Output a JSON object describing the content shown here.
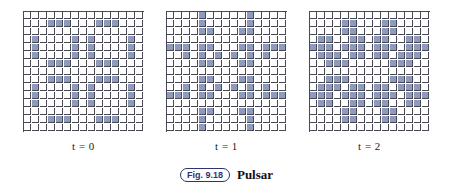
{
  "figure": {
    "tag": "Fig. 9.18",
    "title": "Pulsar",
    "colors": {
      "live_cell": "#8f9abf",
      "dead_cell": "#ffffff",
      "grid_line": "#4a4a55",
      "tag_text": "#2d3470",
      "caption_text": "#111118"
    }
  },
  "panels": [
    {
      "label": "t = 0",
      "grid": {
        "rows": 15,
        "cols": 15,
        "live": [
          [
            1,
            3
          ],
          [
            1,
            4
          ],
          [
            1,
            5
          ],
          [
            1,
            9
          ],
          [
            1,
            10
          ],
          [
            1,
            11
          ],
          [
            3,
            1
          ],
          [
            3,
            6
          ],
          [
            3,
            8
          ],
          [
            3,
            13
          ],
          [
            4,
            1
          ],
          [
            4,
            6
          ],
          [
            4,
            8
          ],
          [
            4,
            13
          ],
          [
            5,
            1
          ],
          [
            5,
            6
          ],
          [
            5,
            8
          ],
          [
            5,
            13
          ],
          [
            6,
            3
          ],
          [
            6,
            4
          ],
          [
            6,
            5
          ],
          [
            6,
            9
          ],
          [
            6,
            10
          ],
          [
            6,
            11
          ],
          [
            8,
            3
          ],
          [
            8,
            4
          ],
          [
            8,
            5
          ],
          [
            8,
            9
          ],
          [
            8,
            10
          ],
          [
            8,
            11
          ],
          [
            9,
            1
          ],
          [
            9,
            6
          ],
          [
            9,
            8
          ],
          [
            9,
            13
          ],
          [
            10,
            1
          ],
          [
            10,
            6
          ],
          [
            10,
            8
          ],
          [
            10,
            13
          ],
          [
            11,
            1
          ],
          [
            11,
            6
          ],
          [
            11,
            8
          ],
          [
            11,
            13
          ],
          [
            13,
            3
          ],
          [
            13,
            4
          ],
          [
            13,
            5
          ],
          [
            13,
            9
          ],
          [
            13,
            10
          ],
          [
            13,
            11
          ]
        ]
      }
    },
    {
      "label": "t = 1",
      "grid": {
        "rows": 15,
        "cols": 15,
        "live": [
          [
            0,
            4
          ],
          [
            0,
            10
          ],
          [
            1,
            4
          ],
          [
            1,
            10
          ],
          [
            2,
            4
          ],
          [
            2,
            5
          ],
          [
            2,
            9
          ],
          [
            2,
            10
          ],
          [
            4,
            0
          ],
          [
            4,
            1
          ],
          [
            4,
            2
          ],
          [
            4,
            4
          ],
          [
            4,
            5
          ],
          [
            4,
            9
          ],
          [
            4,
            10
          ],
          [
            4,
            12
          ],
          [
            4,
            13
          ],
          [
            4,
            14
          ],
          [
            5,
            2
          ],
          [
            5,
            4
          ],
          [
            5,
            6
          ],
          [
            5,
            8
          ],
          [
            5,
            10
          ],
          [
            5,
            12
          ],
          [
            6,
            4
          ],
          [
            6,
            5
          ],
          [
            6,
            9
          ],
          [
            6,
            10
          ],
          [
            8,
            4
          ],
          [
            8,
            5
          ],
          [
            8,
            9
          ],
          [
            8,
            10
          ],
          [
            9,
            2
          ],
          [
            9,
            4
          ],
          [
            9,
            6
          ],
          [
            9,
            8
          ],
          [
            9,
            10
          ],
          [
            9,
            12
          ],
          [
            10,
            0
          ],
          [
            10,
            1
          ],
          [
            10,
            2
          ],
          [
            10,
            4
          ],
          [
            10,
            5
          ],
          [
            10,
            9
          ],
          [
            10,
            10
          ],
          [
            10,
            12
          ],
          [
            10,
            13
          ],
          [
            10,
            14
          ],
          [
            12,
            4
          ],
          [
            12,
            5
          ],
          [
            12,
            9
          ],
          [
            12,
            10
          ],
          [
            13,
            4
          ],
          [
            13,
            10
          ],
          [
            14,
            4
          ],
          [
            14,
            10
          ]
        ]
      }
    },
    {
      "label": "t = 2",
      "grid": {
        "rows": 15,
        "cols": 15,
        "live": [
          [
            1,
            4
          ],
          [
            1,
            5
          ],
          [
            1,
            9
          ],
          [
            1,
            10
          ],
          [
            2,
            4
          ],
          [
            2,
            5
          ],
          [
            2,
            9
          ],
          [
            2,
            10
          ],
          [
            3,
            1
          ],
          [
            3,
            2
          ],
          [
            3,
            5
          ],
          [
            3,
            6
          ],
          [
            3,
            8
          ],
          [
            3,
            9
          ],
          [
            3,
            12
          ],
          [
            3,
            13
          ],
          [
            4,
            0
          ],
          [
            4,
            1
          ],
          [
            4,
            2
          ],
          [
            4,
            4
          ],
          [
            4,
            5
          ],
          [
            4,
            6
          ],
          [
            4,
            8
          ],
          [
            4,
            9
          ],
          [
            4,
            10
          ],
          [
            4,
            12
          ],
          [
            4,
            13
          ],
          [
            4,
            14
          ],
          [
            5,
            1
          ],
          [
            5,
            2
          ],
          [
            5,
            3
          ],
          [
            5,
            5
          ],
          [
            5,
            6
          ],
          [
            5,
            8
          ],
          [
            5,
            9
          ],
          [
            5,
            11
          ],
          [
            5,
            12
          ],
          [
            5,
            13
          ],
          [
            6,
            2
          ],
          [
            6,
            3
          ],
          [
            6,
            4
          ],
          [
            6,
            10
          ],
          [
            6,
            11
          ],
          [
            6,
            12
          ],
          [
            8,
            2
          ],
          [
            8,
            3
          ],
          [
            8,
            4
          ],
          [
            8,
            10
          ],
          [
            8,
            11
          ],
          [
            8,
            12
          ],
          [
            9,
            1
          ],
          [
            9,
            2
          ],
          [
            9,
            3
          ],
          [
            9,
            5
          ],
          [
            9,
            6
          ],
          [
            9,
            8
          ],
          [
            9,
            9
          ],
          [
            9,
            11
          ],
          [
            9,
            12
          ],
          [
            9,
            13
          ],
          [
            10,
            0
          ],
          [
            10,
            1
          ],
          [
            10,
            2
          ],
          [
            10,
            4
          ],
          [
            10,
            5
          ],
          [
            10,
            6
          ],
          [
            10,
            8
          ],
          [
            10,
            9
          ],
          [
            10,
            10
          ],
          [
            10,
            12
          ],
          [
            10,
            13
          ],
          [
            10,
            14
          ],
          [
            11,
            1
          ],
          [
            11,
            2
          ],
          [
            11,
            5
          ],
          [
            11,
            6
          ],
          [
            11,
            8
          ],
          [
            11,
            9
          ],
          [
            11,
            12
          ],
          [
            11,
            13
          ],
          [
            12,
            4
          ],
          [
            12,
            5
          ],
          [
            12,
            9
          ],
          [
            12,
            10
          ],
          [
            13,
            4
          ],
          [
            13,
            5
          ],
          [
            13,
            9
          ],
          [
            13,
            10
          ]
        ]
      }
    }
  ]
}
